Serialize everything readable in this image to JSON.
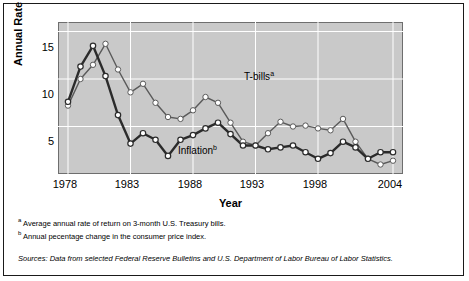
{
  "chart_data": {
    "type": "line",
    "title": "",
    "xlabel": "Year",
    "ylabel": "Annual Rate (%)",
    "xlim": [
      1977.2,
      2004.8
    ],
    "ylim": [
      0,
      16
    ],
    "yticks": [
      5,
      10,
      15
    ],
    "xticks": [
      1978,
      1983,
      1988,
      1993,
      1998,
      2004
    ],
    "grid": true,
    "legend_position": "inline-annotations",
    "x": [
      1978,
      1979,
      1980,
      1981,
      1982,
      1983,
      1984,
      1985,
      1986,
      1987,
      1988,
      1989,
      1990,
      1991,
      1992,
      1993,
      1994,
      1995,
      1996,
      1997,
      1998,
      1999,
      2000,
      2001,
      2002,
      2003,
      2004
    ],
    "series": [
      {
        "name": "T-bills",
        "label": "T-bills",
        "superscript": "a",
        "color": "#ffffff",
        "line_color": "#5a5a5a",
        "values": [
          7.2,
          10.0,
          11.5,
          13.7,
          11.0,
          8.6,
          9.5,
          7.5,
          6.0,
          5.8,
          6.7,
          8.1,
          7.5,
          5.4,
          3.4,
          3.0,
          4.3,
          5.5,
          5.0,
          5.1,
          4.8,
          4.6,
          5.8,
          3.4,
          1.6,
          1.0,
          1.4
        ]
      },
      {
        "name": "Inflation",
        "label": "Inflation",
        "superscript": "b",
        "color": "#ffffff",
        "line_color": "#2b2b2b",
        "values": [
          7.6,
          11.3,
          13.5,
          10.3,
          6.2,
          3.2,
          4.3,
          3.6,
          1.9,
          3.6,
          4.1,
          4.8,
          5.4,
          4.2,
          3.0,
          3.0,
          2.6,
          2.8,
          3.0,
          2.3,
          1.6,
          2.2,
          3.4,
          2.8,
          1.6,
          2.3,
          2.3
        ]
      }
    ]
  },
  "annotations": {
    "tbills_label": "T-bills",
    "tbills_sup": "a",
    "inflation_label": "Inflation",
    "inflation_sup": "b"
  },
  "axis": {
    "ylabel": "Annual Rate (%)",
    "xlabel": "Year",
    "yticks": [
      "15",
      "10",
      "5"
    ],
    "xticks": [
      "1978",
      "1983",
      "1988",
      "1993",
      "1998",
      "2004"
    ]
  },
  "notes": {
    "note_a_sup": "a",
    "note_a": "Average annual rate of return on 3-month U.S. Treasury bills.",
    "note_b_sup": "b",
    "note_b": "Annual pecentage change in the consumer price index.",
    "sources": "Sources: Data from selected Federal Reserve Bulletins and U.S. Department of Labor Bureau of Labor Statistics."
  }
}
